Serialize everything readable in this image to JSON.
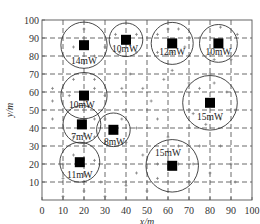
{
  "chart_data": {
    "type": "scatter",
    "title": "",
    "xlabel": "x/m",
    "ylabel": "y/m",
    "xlim": [
      0,
      100
    ],
    "ylim": [
      0,
      100
    ],
    "xticks": [
      0,
      10,
      20,
      30,
      40,
      50,
      60,
      70,
      80,
      90,
      100
    ],
    "yticks": [
      10,
      20,
      30,
      40,
      50,
      60,
      70,
      80,
      90,
      100
    ],
    "grid": "dashed",
    "nodes": [
      {
        "x": 20,
        "y": 86,
        "radius": 11,
        "power": "14mW",
        "label_dx": 0,
        "label_dy": -9
      },
      {
        "x": 40,
        "y": 89,
        "radius": 8,
        "power": "10mW",
        "label_dx": -1,
        "label_dy": -5
      },
      {
        "x": 62,
        "y": 87,
        "radius": 10,
        "power": "12mW",
        "label_dx": 0,
        "label_dy": -5
      },
      {
        "x": 84,
        "y": 87,
        "radius": 9,
        "power": "10mW",
        "label_dx": 0,
        "label_dy": -5
      },
      {
        "x": 80,
        "y": 54,
        "radius": 13,
        "power": "15mW",
        "label_dx": 0,
        "label_dy": -8
      },
      {
        "x": 20,
        "y": 58,
        "radius": 11,
        "power": "10mW",
        "label_dx": -2,
        "label_dy": -5
      },
      {
        "x": 19,
        "y": 42,
        "radius": 9,
        "power": "7mW",
        "label_dx": 0,
        "label_dy": -7
      },
      {
        "x": 34,
        "y": 39,
        "radius": 8,
        "power": "8mW",
        "label_dx": 1,
        "label_dy": -7
      },
      {
        "x": 18,
        "y": 21,
        "radius": 9.5,
        "power": "11mW",
        "label_dx": 0,
        "label_dy": -7
      },
      {
        "x": 62,
        "y": 19,
        "radius": 12.5,
        "power": "15mW",
        "label_dx": -4,
        "label_dy": 7
      }
    ],
    "sensors": [
      [
        20,
        95
      ],
      [
        15,
        85
      ],
      [
        25,
        80
      ],
      [
        10,
        80
      ],
      [
        30,
        85
      ],
      [
        35,
        92
      ],
      [
        45,
        92
      ],
      [
        37,
        82
      ],
      [
        45,
        82
      ],
      [
        55,
        92
      ],
      [
        60,
        95
      ],
      [
        65,
        95
      ],
      [
        68,
        85
      ],
      [
        55,
        82
      ],
      [
        62,
        82
      ],
      [
        75,
        90
      ],
      [
        82,
        78
      ],
      [
        90,
        78
      ],
      [
        93,
        92
      ],
      [
        85,
        96
      ],
      [
        15,
        67
      ],
      [
        25,
        67
      ],
      [
        5,
        62
      ],
      [
        5,
        55
      ],
      [
        13,
        58
      ],
      [
        25,
        62
      ],
      [
        22,
        52
      ],
      [
        30,
        58
      ],
      [
        38,
        62
      ],
      [
        42,
        70
      ],
      [
        48,
        62
      ],
      [
        52,
        55
      ],
      [
        58,
        67
      ],
      [
        62,
        72
      ],
      [
        70,
        65
      ],
      [
        75,
        62
      ],
      [
        82,
        65
      ],
      [
        88,
        60
      ],
      [
        92,
        50
      ],
      [
        85,
        45
      ],
      [
        78,
        42
      ],
      [
        72,
        48
      ],
      [
        80,
        70
      ],
      [
        5,
        45
      ],
      [
        10,
        40
      ],
      [
        25,
        45
      ],
      [
        15,
        35
      ],
      [
        25,
        35
      ],
      [
        30,
        45
      ],
      [
        38,
        45
      ],
      [
        40,
        32
      ],
      [
        45,
        40
      ],
      [
        55,
        45
      ],
      [
        60,
        35
      ],
      [
        48,
        25
      ],
      [
        10,
        20
      ],
      [
        15,
        25
      ],
      [
        25,
        22
      ],
      [
        20,
        30
      ],
      [
        10,
        12
      ],
      [
        28,
        10
      ],
      [
        20,
        5
      ],
      [
        10,
        2
      ],
      [
        30,
        2
      ],
      [
        55,
        20
      ],
      [
        65,
        20
      ],
      [
        72,
        20
      ],
      [
        60,
        10
      ],
      [
        55,
        12
      ],
      [
        70,
        10
      ],
      [
        65,
        30
      ],
      [
        75,
        30
      ],
      [
        85,
        30
      ],
      [
        90,
        20
      ],
      [
        92,
        10
      ],
      [
        80,
        15
      ],
      [
        45,
        15
      ],
      [
        40,
        8
      ],
      [
        50,
        5
      ]
    ]
  }
}
